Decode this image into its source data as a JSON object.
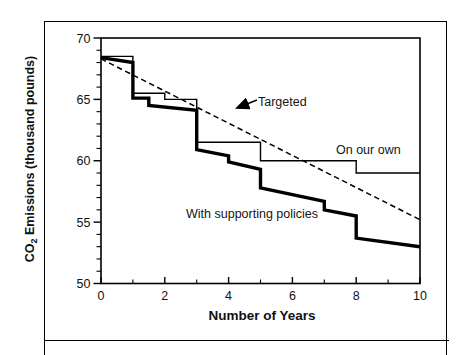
{
  "figure": {
    "y_axis_title": {
      "prefix": "CO",
      "sub": "2",
      "suffix": " Emissions (thousand pounds)"
    }
  },
  "chart_data": {
    "type": "line",
    "title": "",
    "xlabel": "Number of Years",
    "ylabel": "CO2 Emissions (thousand pounds)",
    "xlim": [
      0,
      10
    ],
    "ylim": [
      50,
      70
    ],
    "x_major_ticks": [
      0,
      2,
      4,
      6,
      8,
      10
    ],
    "x_minor_ticks": [
      1,
      3,
      5,
      7,
      9
    ],
    "y_major_ticks": [
      50,
      55,
      60,
      65,
      70
    ],
    "y_minor_ticks": [
      51,
      52,
      53,
      54,
      56,
      57,
      58,
      59,
      61,
      62,
      63,
      64,
      66,
      67,
      68,
      69
    ],
    "grid": false,
    "legend_position": "none (inline annotations)",
    "series": [
      {
        "name": "Targeted",
        "key": "targeted",
        "line_style": "dashed",
        "points": [
          [
            0,
            68.3
          ],
          [
            10,
            55.2
          ]
        ]
      },
      {
        "name": "On our own",
        "key": "on-our-own",
        "line_style": "thin-solid",
        "points": [
          [
            0,
            68.5
          ],
          [
            1,
            68.5
          ],
          [
            1,
            65.5
          ],
          [
            2,
            65.5
          ],
          [
            2,
            65.0
          ],
          [
            3,
            65.0
          ],
          [
            3,
            61.5
          ],
          [
            5,
            61.5
          ],
          [
            5,
            60.0
          ],
          [
            8,
            60.0
          ],
          [
            8,
            59.0
          ],
          [
            10,
            59.0
          ]
        ]
      },
      {
        "name": "With supporting policies",
        "key": "with-supporting-policies",
        "line_style": "thick-solid",
        "points": [
          [
            0,
            68.4
          ],
          [
            1,
            68.0
          ],
          [
            1,
            65.1
          ],
          [
            1.5,
            65.1
          ],
          [
            1.5,
            64.5
          ],
          [
            3,
            64.1
          ],
          [
            3,
            60.9
          ],
          [
            4,
            60.4
          ],
          [
            4,
            59.9
          ],
          [
            5,
            59.3
          ],
          [
            5,
            57.8
          ],
          [
            7,
            56.7
          ],
          [
            7,
            56.0
          ],
          [
            8,
            55.5
          ],
          [
            8,
            53.7
          ],
          [
            10,
            53.0
          ]
        ]
      }
    ],
    "annotations": [
      {
        "text": "Targeted",
        "target_series": "Targeted",
        "has_arrow": true
      },
      {
        "text": "On our own",
        "target_series": "On our own",
        "has_arrow": false
      },
      {
        "text": "With supporting policies",
        "target_series": "With supporting policies",
        "has_arrow": false
      }
    ]
  }
}
